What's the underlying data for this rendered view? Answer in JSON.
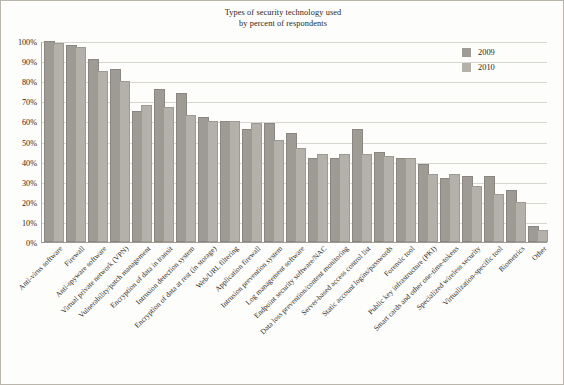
{
  "title": {
    "line1": "Types of security technology used",
    "line2": "by percent of respondents"
  },
  "legend": {
    "position": "top-right",
    "items": [
      {
        "label": "2009",
        "color": "#9e9a94"
      },
      {
        "label": "2010",
        "color": "#b4b0aa"
      }
    ]
  },
  "axis": {
    "yticks": [
      "0%",
      "10%",
      "20%",
      "30%",
      "40%",
      "50%",
      "60%",
      "70%",
      "80%",
      "90%",
      "100%"
    ]
  },
  "chart_data": {
    "type": "bar",
    "title": "Types of security technology used by percent of respondents",
    "xlabel": "",
    "ylabel": "",
    "ylim": [
      0,
      100
    ],
    "ytick_values": [
      0,
      10,
      20,
      30,
      40,
      50,
      60,
      70,
      80,
      90,
      100
    ],
    "grid": true,
    "legend_position": "top-right",
    "categories": [
      "Anti-virus software",
      "Firewall",
      "Anti-spyware software",
      "Virtual private network (VPN)",
      "Vulnerability/patch management",
      "Encryption of data in transit",
      "Intrusion detection system",
      "Encryption of data at rest (in storage)",
      "Web/URL filtering",
      "Application firewall",
      "Intrusion prevention system",
      "Log management software",
      "Endpoint security software/NAC",
      "Data loss prevention/content monitoring",
      "Server-based access control list",
      "Static account logins/passwords",
      "Forensic tool",
      "Public key infrastructure (PKI)",
      "Smart cards and other one-time-tokens",
      "Specialized wireless security",
      "Virtualization-specific tool",
      "Biometrics",
      "Other"
    ],
    "series": [
      {
        "name": "2009",
        "color": "#9e9a94",
        "values": [
          99,
          97,
          90,
          85,
          64,
          75,
          73,
          61,
          59,
          55,
          58,
          53,
          41,
          41,
          55,
          44,
          41,
          38,
          31,
          32,
          32,
          25,
          7
        ]
      },
      {
        "name": "2010",
        "color": "#b4b0aa",
        "values": [
          98,
          96,
          84,
          79,
          67,
          66,
          62,
          59,
          59,
          58,
          50,
          46,
          43,
          43,
          43,
          42,
          41,
          33,
          33,
          27,
          23,
          19,
          5
        ]
      }
    ]
  }
}
